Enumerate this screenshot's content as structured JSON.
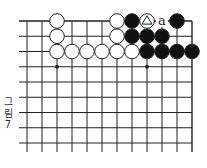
{
  "figure": {
    "caption_lines": [
      "그",
      "림",
      "7"
    ],
    "caption": "그림 7"
  },
  "board": {
    "orientation": "top-right corner",
    "cols": 12,
    "rows": 9,
    "origin_x": 27,
    "origin_y": 21,
    "spacing_x": 15,
    "spacing_y": 15.25,
    "stone_radius": 7.3,
    "colors": {
      "line": "#222222",
      "black": "#111111",
      "white": "#ffffff",
      "stone_outline": "#222222"
    },
    "star_points": [
      {
        "col": 2,
        "row": 3
      },
      {
        "col": 8,
        "row": 3
      }
    ],
    "stones": [
      {
        "col": 2,
        "row": 0,
        "color": "white"
      },
      {
        "col": 6,
        "row": 0,
        "color": "white"
      },
      {
        "col": 7,
        "row": 0,
        "color": "black"
      },
      {
        "col": 8,
        "row": 0,
        "color": "white",
        "mark": "triangle"
      },
      {
        "col": 10,
        "row": 0,
        "color": "black"
      },
      {
        "col": 2,
        "row": 1,
        "color": "white"
      },
      {
        "col": 6,
        "row": 1,
        "color": "white"
      },
      {
        "col": 7,
        "row": 1,
        "color": "black"
      },
      {
        "col": 8,
        "row": 1,
        "color": "black"
      },
      {
        "col": 9,
        "row": 1,
        "color": "black"
      },
      {
        "col": 2,
        "row": 2,
        "color": "white"
      },
      {
        "col": 3,
        "row": 2,
        "color": "white"
      },
      {
        "col": 4,
        "row": 2,
        "color": "white"
      },
      {
        "col": 5,
        "row": 2,
        "color": "white"
      },
      {
        "col": 6,
        "row": 2,
        "color": "white"
      },
      {
        "col": 7,
        "row": 2,
        "color": "white"
      },
      {
        "col": 8,
        "row": 2,
        "color": "black"
      },
      {
        "col": 9,
        "row": 2,
        "color": "black"
      },
      {
        "col": 10,
        "row": 2,
        "color": "black"
      },
      {
        "col": 11,
        "row": 2,
        "color": "black"
      }
    ],
    "labels": [
      {
        "col": 9,
        "row": 0,
        "text": "a"
      }
    ]
  }
}
